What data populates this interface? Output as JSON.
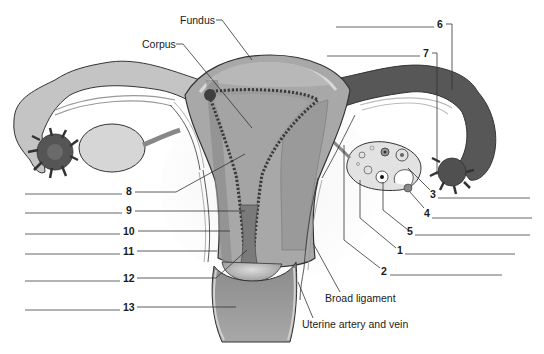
{
  "diagram": {
    "colors": {
      "background": "#ffffff",
      "tube_light": "#c4c4c4",
      "tube_dark": "#555555",
      "uterine_wall": "#a8a8a8",
      "myometrium": "#8f8f8f",
      "endometrium": "#4a4a4a",
      "cavity": "#9a9a9a",
      "ligament": "#ececec",
      "outline": "#333333"
    },
    "text_labels": {
      "fundus": "Fundus",
      "corpus": "Corpus",
      "broad_ligament": "Broad ligament",
      "uterine_vessels": "Uterine artery and vein"
    },
    "numbered_labels_left": [
      {
        "num": "8",
        "answer_blank": ""
      },
      {
        "num": "9",
        "answer_blank": ""
      },
      {
        "num": "10",
        "answer_blank": ""
      },
      {
        "num": "11",
        "answer_blank": ""
      },
      {
        "num": "12",
        "answer_blank": ""
      },
      {
        "num": "13",
        "answer_blank": ""
      }
    ],
    "numbered_labels_right": [
      {
        "num": "3",
        "answer_blank": ""
      },
      {
        "num": "4",
        "answer_blank": ""
      },
      {
        "num": "5",
        "answer_blank": ""
      },
      {
        "num": "1",
        "answer_blank": ""
      },
      {
        "num": "2",
        "answer_blank": ""
      }
    ],
    "numbered_labels_top": [
      {
        "num": "6",
        "answer_blank": ""
      },
      {
        "num": "7",
        "answer_blank": ""
      }
    ]
  }
}
